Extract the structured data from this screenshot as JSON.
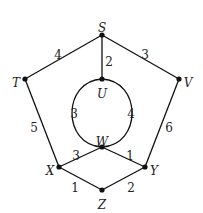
{
  "graph": {
    "nodes": [
      {
        "id": "S",
        "label": "S",
        "x": 102,
        "y": 35,
        "lx": 102,
        "ly": 28
      },
      {
        "id": "T",
        "label": "T",
        "x": 25,
        "y": 79,
        "lx": 16,
        "ly": 83
      },
      {
        "id": "V",
        "label": "V",
        "x": 179,
        "y": 79,
        "lx": 188,
        "ly": 83
      },
      {
        "id": "U",
        "label": "U",
        "x": 102,
        "y": 79,
        "lx": 102,
        "ly": 94
      },
      {
        "id": "W",
        "label": "W",
        "x": 102,
        "y": 147,
        "lx": 102,
        "ly": 142
      },
      {
        "id": "X",
        "label": "X",
        "x": 59,
        "y": 167,
        "lx": 50,
        "ly": 171
      },
      {
        "id": "Y",
        "label": "Y",
        "x": 145,
        "y": 167,
        "lx": 154,
        "ly": 171
      },
      {
        "id": "Z",
        "label": "Z",
        "x": 102,
        "y": 190,
        "lx": 102,
        "ly": 205
      }
    ],
    "edges": [
      {
        "from": "S",
        "to": "T",
        "weight": "4",
        "wx": 58,
        "wy": 55
      },
      {
        "from": "S",
        "to": "V",
        "weight": "3",
        "wx": 145,
        "wy": 55
      },
      {
        "from": "S",
        "to": "U",
        "weight": "2",
        "wx": 109,
        "wy": 62
      },
      {
        "from": "T",
        "to": "X",
        "weight": "5",
        "wx": 34,
        "wy": 128
      },
      {
        "from": "V",
        "to": "Y",
        "weight": "6",
        "wx": 169,
        "wy": 128
      },
      {
        "from": "U",
        "to": "W",
        "weight": "3",
        "curve": "left",
        "wx": 74,
        "wy": 114
      },
      {
        "from": "U",
        "to": "W",
        "weight": "4",
        "curve": "right",
        "wx": 131,
        "wy": 114
      },
      {
        "from": "W",
        "to": "X",
        "weight": "3",
        "wx": 76,
        "wy": 156
      },
      {
        "from": "W",
        "to": "Y",
        "weight": "1",
        "wx": 130,
        "wy": 156
      },
      {
        "from": "X",
        "to": "Z",
        "weight": "1",
        "wx": 75,
        "wy": 188
      },
      {
        "from": "Z",
        "to": "Y",
        "weight": "2",
        "wx": 131,
        "wy": 188
      }
    ]
  }
}
